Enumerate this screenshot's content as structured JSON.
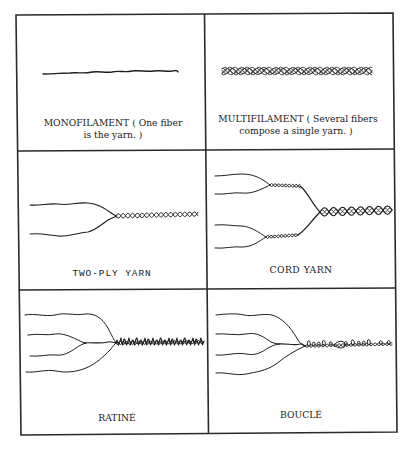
{
  "figure": {
    "panels": [
      {
        "id": "monofilament",
        "caption_lines": [
          "MONOFILAMENT ( One fiber",
          "is the yarn. )"
        ],
        "drawing": "single-strand"
      },
      {
        "id": "multifilament",
        "caption_lines": [
          "MULTIFILAMENT ( Several fibers",
          "compose a single yarn. )"
        ],
        "drawing": "bundle-of-twisted-filaments"
      },
      {
        "id": "two-ply",
        "caption_lines": [
          "TWO-PLY YARN"
        ],
        "drawing": "two-strands-twisted-into-one"
      },
      {
        "id": "cord",
        "caption_lines": [
          "CORD YARN"
        ],
        "drawing": "two-plied-yarns-twisted-together"
      },
      {
        "id": "ratine",
        "caption_lines": [
          "RATINÉ"
        ],
        "drawing": "four-strands-with-knotty-twist"
      },
      {
        "id": "boucle",
        "caption_lines": [
          "BOUCLÉ"
        ],
        "drawing": "four-strands-with-looped-twist"
      }
    ]
  }
}
